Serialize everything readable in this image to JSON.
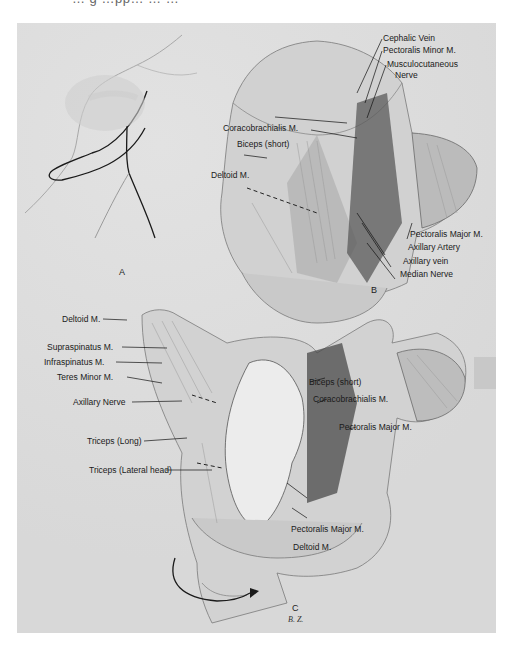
{
  "page": {
    "top_fragment": "… g …pp… … …",
    "panels": [
      {
        "id": "A",
        "letter": "A"
      },
      {
        "id": "B",
        "letter": "B",
        "labels": [
          "Cephalic Vein",
          "Pectoralis Minor M.",
          "Musculocutaneous",
          "Nerve",
          "Coracobrachialis M.",
          "Biceps (short)",
          "Deltoid M.",
          "Pectoralis Major M.",
          "Axillary Artery",
          "Axillary vein",
          "Median Nerve"
        ]
      },
      {
        "id": "C",
        "letter": "C",
        "signature": "B. Z.",
        "labels": [
          "Deltoid M.",
          "Supraspinatus M.",
          "Infraspinatus M.",
          "Teres Minor M.",
          "Axillary Nerve",
          "Triceps (Long)",
          "Triceps (Lateral head)",
          "Biceps (short)",
          "Coracobrachialis M.",
          "Pectoralis Major M.",
          "Pectoralis Major M.",
          "Deltoid M."
        ]
      }
    ]
  }
}
